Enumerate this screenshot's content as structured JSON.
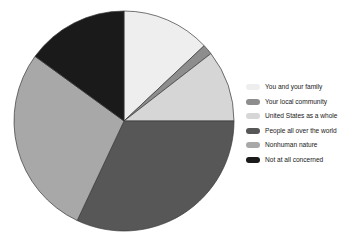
{
  "chart_data": {
    "type": "pie",
    "title": "",
    "subtitle": "",
    "xlabel": "",
    "ylabel": "",
    "grid": false,
    "legend_position": "right",
    "start_angle_deg": 0,
    "direction": "clockwise",
    "categories": [
      "You and your family",
      "Your local community",
      "United States as a whole",
      "People all over the world",
      "Nonhuman nature",
      "Not at all concerned"
    ],
    "values": [
      13,
      1.5,
      10.5,
      32,
      28,
      15
    ],
    "colors": [
      "#eeeeee",
      "#8d8d8d",
      "#d6d6d6",
      "#575757",
      "#a8a8a8",
      "#1a1a1a"
    ],
    "slices": [
      {
        "label": "You and your family",
        "value": 13,
        "color": "#eeeeee",
        "start_deg": 0,
        "end_deg": 46.8
      },
      {
        "label": "Your local community",
        "value": 1.5,
        "color": "#8d8d8d",
        "start_deg": 46.8,
        "end_deg": 52.2
      },
      {
        "label": "United States as a whole",
        "value": 10.5,
        "color": "#d6d6d6",
        "start_deg": 52.2,
        "end_deg": 90.0
      },
      {
        "label": "People all over the world",
        "value": 32,
        "color": "#575757",
        "start_deg": 90.0,
        "end_deg": 205.2
      },
      {
        "label": "Nonhuman nature",
        "value": 28,
        "color": "#a8a8a8",
        "start_deg": 205.2,
        "end_deg": 306.0
      },
      {
        "label": "Not at all concerned",
        "value": 15,
        "color": "#1a1a1a",
        "start_deg": 306.0,
        "end_deg": 360.0
      }
    ],
    "geometry": {
      "cx": 112,
      "cy": 115,
      "r": 110,
      "stroke": "#3a3a3a",
      "stroke_width": 0.7
    }
  },
  "legend": {
    "items": [
      {
        "label": "You and your family",
        "color": "#eeeeee"
      },
      {
        "label": "Your local community",
        "color": "#8d8d8d"
      },
      {
        "label": "United States as a whole",
        "color": "#d6d6d6"
      },
      {
        "label": "People all over the world",
        "color": "#575757"
      },
      {
        "label": "Nonhuman nature",
        "color": "#a8a8a8"
      },
      {
        "label": "Not at all concerned",
        "color": "#1a1a1a"
      }
    ]
  }
}
